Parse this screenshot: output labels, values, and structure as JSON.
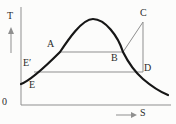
{
  "figure": {
    "kind": "temperature-entropy-diagram",
    "axes": {
      "y_label": "T",
      "x_label": "S",
      "origin_label": "0"
    },
    "point_labels": {
      "A": "A",
      "B": "B",
      "C": "C",
      "D": "D",
      "E_prime": "E′",
      "E": "E"
    },
    "colors": {
      "background": "#fcfcfb",
      "curve": "#161616",
      "process_line": "#8f8f8f",
      "axis": "#8f8f8f",
      "label_text": "#2b2b2b"
    }
  }
}
